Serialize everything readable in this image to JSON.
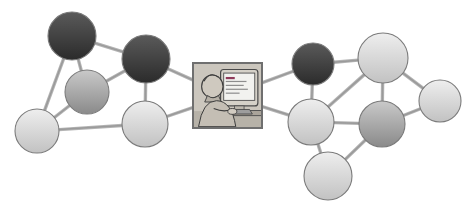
{
  "figure": {
    "type": "social-network-diagram",
    "title": "",
    "background_color": "#ffffff",
    "edge_color": "#9a9a9a",
    "node_border_color": "#7b7b7b"
  },
  "center": {
    "name": "person-at-computer",
    "label": "",
    "x": 193,
    "y": 63,
    "width": 69,
    "height": 65,
    "shape": "square",
    "frame_color": "#6f6f6f",
    "fill": "#cdc8bf",
    "screen_color": "#f2f2ef",
    "screen_text_color": "#8f3a5a"
  },
  "nodes": [
    {
      "id": "n1",
      "name": "node-group-photo-top-left",
      "label": "",
      "cx": 72,
      "cy": 36,
      "r": 25,
      "tone": "dark",
      "portrait": "crowd"
    },
    {
      "id": "n2",
      "name": "node-family-photo-left",
      "label": "",
      "cx": 87,
      "cy": 92,
      "r": 23,
      "tone": "mid",
      "portrait": "family"
    },
    {
      "id": "n3",
      "name": "node-girl-portrait-left",
      "label": "",
      "cx": 37,
      "cy": 131,
      "r": 23,
      "tone": "light",
      "portrait": "girl"
    },
    {
      "id": "n4",
      "name": "node-man-with-glasses",
      "label": "",
      "cx": 146,
      "cy": 59,
      "r": 25,
      "tone": "dark",
      "portrait": "glasses-man"
    },
    {
      "id": "n5",
      "name": "node-couple",
      "label": "",
      "cx": 145,
      "cy": 124,
      "r": 24,
      "tone": "light",
      "portrait": "couple"
    },
    {
      "id": "n6",
      "name": "node-girl-waving",
      "label": "",
      "cx": 313,
      "cy": 64,
      "r": 22,
      "tone": "dark",
      "portrait": "waving-girl"
    },
    {
      "id": "n7",
      "name": "node-blonde-woman",
      "label": "",
      "cx": 383,
      "cy": 58,
      "r": 26,
      "tone": "light",
      "portrait": "blonde-woman"
    },
    {
      "id": "n8",
      "name": "node-boy-right",
      "label": "",
      "cx": 440,
      "cy": 101,
      "r": 22,
      "tone": "light",
      "portrait": "boy"
    },
    {
      "id": "n9",
      "name": "node-cheering-person",
      "label": "",
      "cx": 311,
      "cy": 122,
      "r": 24,
      "tone": "light",
      "portrait": "cheering"
    },
    {
      "id": "n10",
      "name": "node-man-in-suit",
      "label": "",
      "cx": 382,
      "cy": 124,
      "r": 24,
      "tone": "mid",
      "portrait": "suit-man"
    },
    {
      "id": "n11",
      "name": "node-family-group-bottom",
      "label": "",
      "cx": 328,
      "cy": 176,
      "r": 25,
      "tone": "light",
      "portrait": "group"
    }
  ],
  "edges": [
    {
      "name": "edge-n1-n2",
      "from": "n1",
      "to": "n2"
    },
    {
      "name": "edge-n1-n3",
      "from": "n1",
      "to": "n3"
    },
    {
      "name": "edge-n1-n4",
      "from": "n1",
      "to": "n4"
    },
    {
      "name": "edge-n2-n3",
      "from": "n2",
      "to": "n3"
    },
    {
      "name": "edge-n2-n4",
      "from": "n2",
      "to": "n4"
    },
    {
      "name": "edge-n3-n5",
      "from": "n3",
      "to": "n5"
    },
    {
      "name": "edge-n4-n5",
      "from": "n4",
      "to": "n5"
    },
    {
      "name": "edge-n4-center",
      "from": "n4",
      "to": "center"
    },
    {
      "name": "edge-n5-center",
      "from": "n5",
      "to": "center"
    },
    {
      "name": "edge-center-n6",
      "from": "center",
      "to": "n6"
    },
    {
      "name": "edge-center-n9",
      "from": "center",
      "to": "n9"
    },
    {
      "name": "edge-n6-n7",
      "from": "n6",
      "to": "n7"
    },
    {
      "name": "edge-n6-n9",
      "from": "n6",
      "to": "n9"
    },
    {
      "name": "edge-n7-n8",
      "from": "n7",
      "to": "n8"
    },
    {
      "name": "edge-n7-n9",
      "from": "n7",
      "to": "n9"
    },
    {
      "name": "edge-n7-n10",
      "from": "n7",
      "to": "n10"
    },
    {
      "name": "edge-n8-n10",
      "from": "n8",
      "to": "n10"
    },
    {
      "name": "edge-n9-n10",
      "from": "n9",
      "to": "n10"
    },
    {
      "name": "edge-n9-n11",
      "from": "n9",
      "to": "n11"
    },
    {
      "name": "edge-n10-n11",
      "from": "n10",
      "to": "n11"
    }
  ]
}
